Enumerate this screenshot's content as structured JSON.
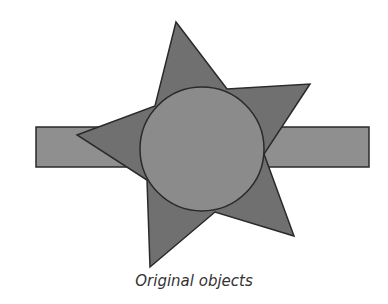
{
  "caption": "Original objects",
  "colors": {
    "rectangle_fill": "#8f8f8f",
    "star_fill": "#707070",
    "circle_fill": "#8b8b8b",
    "stroke": "#2a2a2a"
  },
  "shapes": {
    "rectangle": {
      "x": 36,
      "y": 127,
      "width": 333,
      "height": 40
    },
    "star": {
      "points": "176,22 227,89 310,84 264,154 294,236 215,212 150,267 147,180 77,135 155,106"
    },
    "circle": {
      "cx": 202,
      "cy": 149,
      "r": 62
    }
  }
}
